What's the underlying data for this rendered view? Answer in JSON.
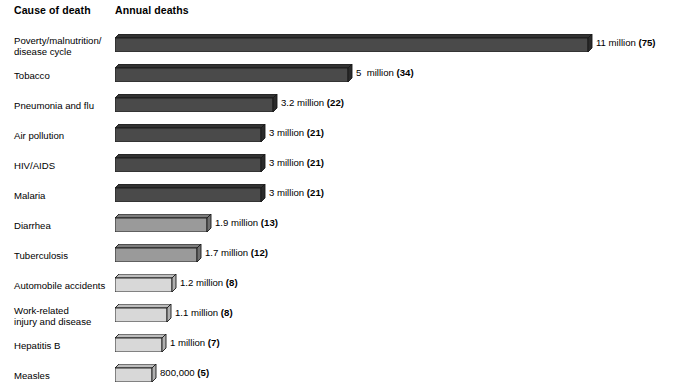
{
  "header": {
    "cause_label": "Cause of death",
    "annual_label": "Annual deaths"
  },
  "colors": {
    "bar_dark_front": "#4a4a4a",
    "bar_dark_top": "#333333",
    "bar_mid_front": "#9a9a9a",
    "bar_mid_top": "#7d7d7d",
    "bar_light_front": "#d8d8d8",
    "bar_light_top": "#bdbdbd",
    "outline": "#1a1a1a",
    "text": "#000000",
    "background": "#ffffff"
  },
  "chart_data": {
    "type": "bar",
    "orientation": "horizontal",
    "title": "",
    "subtitle": "",
    "xlabel": "Annual deaths",
    "ylabel": "Cause of death",
    "grid": false,
    "legend": "none",
    "units": "millions of deaths per year",
    "note": "Number in parentheses is percent share shown as an integer on the chart",
    "xlim": [
      0,
      11
    ],
    "categories": [
      "Poverty/malnutrition/\ndisease cycle",
      "Tobacco",
      "Pneumonia and flu",
      "Air pollution",
      "HIV/AIDS",
      "Malaria",
      "Diarrhea",
      "Tuberculosis",
      "Automobile accidents",
      "Work-related\ninjury and disease",
      "Hepatitis B",
      "Measles"
    ],
    "values": [
      11,
      5,
      3.2,
      3,
      3,
      3,
      1.9,
      1.7,
      1.2,
      1.1,
      1,
      0.8
    ],
    "value_labels": [
      "11 million (75)",
      "5  million (34)",
      "3.2 million (22)",
      "3 million (21)",
      "3 million (21)",
      "3 million (21)",
      "1.9 million (13)",
      "1.7 million (12)",
      "1.2 million (8)",
      "1.1 million (8)",
      "1 million (7)",
      "800,000 (5)"
    ],
    "parenthetical_values": [
      75,
      34,
      22,
      21,
      21,
      21,
      13,
      12,
      8,
      8,
      7,
      5
    ],
    "shades": [
      "dark",
      "dark",
      "dark",
      "dark",
      "dark",
      "dark",
      "mid",
      "mid",
      "light",
      "light",
      "light",
      "light"
    ]
  },
  "rows": [
    {
      "label": "Poverty/malnutrition/\ndisease cycle",
      "value_main": "11 million ",
      "value_paren": "(75)",
      "bar_px": 477,
      "shade": "dark",
      "top": 4
    },
    {
      "label": "Tobacco",
      "value_main": "5  million ",
      "value_paren": "(34)",
      "bar_px": 237,
      "shade": "dark",
      "top": 34
    },
    {
      "label": "Pneumonia and flu",
      "value_main": "3.2 million ",
      "value_paren": "(22)",
      "bar_px": 162,
      "shade": "dark",
      "top": 64
    },
    {
      "label": "Air pollution",
      "value_main": "3 million ",
      "value_paren": "(21)",
      "bar_px": 150,
      "shade": "dark",
      "top": 94
    },
    {
      "label": "HIV/AIDS",
      "value_main": "3 million ",
      "value_paren": "(21)",
      "bar_px": 150,
      "shade": "dark",
      "top": 124
    },
    {
      "label": "Malaria",
      "value_main": "3 million ",
      "value_paren": "(21)",
      "bar_px": 150,
      "shade": "dark",
      "top": 154
    },
    {
      "label": "Diarrhea",
      "value_main": "1.9 million ",
      "value_paren": "(13)",
      "bar_px": 96,
      "shade": "mid",
      "top": 184
    },
    {
      "label": "Tuberculosis",
      "value_main": "1.7 million ",
      "value_paren": "(12)",
      "bar_px": 86,
      "shade": "mid",
      "top": 214
    },
    {
      "label": "Automobile accidents",
      "value_main": "1.2 million ",
      "value_paren": "(8)",
      "bar_px": 61,
      "shade": "light",
      "top": 244
    },
    {
      "label": "Work-related\ninjury and disease",
      "value_main": "1.1 million ",
      "value_paren": "(8)",
      "bar_px": 56,
      "shade": "light",
      "top": 274
    },
    {
      "label": "Hepatitis B",
      "value_main": "1 million ",
      "value_paren": "(7)",
      "bar_px": 51,
      "shade": "light",
      "top": 304
    },
    {
      "label": "Measles",
      "value_main": "800,000 ",
      "value_paren": "(5)",
      "bar_px": 41,
      "shade": "light",
      "top": 334
    }
  ]
}
